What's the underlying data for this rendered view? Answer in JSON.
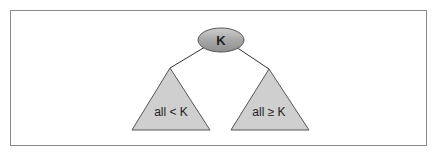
{
  "diagram": {
    "root": {
      "label": "K",
      "fill": "#a9a9a9"
    },
    "left_subtree": {
      "label": "all < K",
      "fill": "#cfcfcf"
    },
    "right_subtree": {
      "label": "all ≥ K",
      "fill": "#cfcfcf"
    },
    "colors": {
      "frame": "#8a8a8a",
      "stroke": "#444444",
      "edge": "#333333"
    }
  }
}
